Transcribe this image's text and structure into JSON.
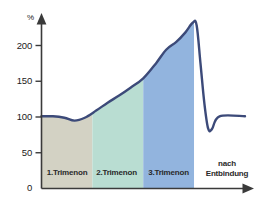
{
  "chart_data": {
    "type": "area",
    "title": "",
    "subtitle": "",
    "xlabel": "",
    "ylabel": "%",
    "ylim": [
      0,
      240
    ],
    "yticks": [
      0,
      50,
      100,
      150,
      200
    ],
    "ytick_labels": [
      "0",
      "50",
      "100",
      "150",
      "200"
    ],
    "grid": false,
    "legend": false,
    "unit": "%",
    "categories": [
      "1.Trimenon",
      "2.Trimenon",
      "3.Trimenon",
      "nach Entbindung"
    ],
    "band_colors": [
      "#d3d2c4",
      "#b9ddd2",
      "#92b4de",
      "#ffffff"
    ],
    "band_ranges": [
      [
        0,
        4
      ],
      [
        4,
        8
      ],
      [
        8,
        12
      ],
      [
        12,
        16
      ]
    ],
    "line_color": "#3c4a79",
    "series": [
      {
        "name": "Blutvolumen",
        "x": [
          0.0,
          0.9,
          1.8,
          2.6,
          3.4,
          4.3,
          5.2,
          6.1,
          7.0,
          8.0,
          9.0,
          9.8,
          10.6,
          11.3,
          11.9,
          12.2,
          12.5,
          12.8,
          13.1,
          13.4,
          14.0,
          16.0
        ],
        "values": [
          101,
          101,
          99,
          95,
          99,
          109,
          120,
          130,
          141,
          154,
          175,
          194,
          205,
          218,
          232,
          228,
          175,
          120,
          84,
          83,
          101,
          101
        ]
      }
    ],
    "annotations": [
      {
        "text": "1.Trimenon",
        "x": 2.0,
        "y": 18
      },
      {
        "text": "2.Trimenon",
        "x": 6.0,
        "y": 18
      },
      {
        "text": "3.Trimenon",
        "x": 10.0,
        "y": 18
      },
      {
        "text": "nach Entbindung",
        "x": 14.0,
        "y": 22
      }
    ]
  },
  "axis": {
    "y_unit": "%",
    "ticks": [
      "200",
      "150",
      "100",
      "50",
      "0"
    ]
  },
  "bands": [
    {
      "label": "1.Trimenon"
    },
    {
      "label": "2.Trimenon"
    },
    {
      "label": "3.Trimenon"
    },
    {
      "label_line1": "nach",
      "label_line2": "Entbindung"
    }
  ]
}
